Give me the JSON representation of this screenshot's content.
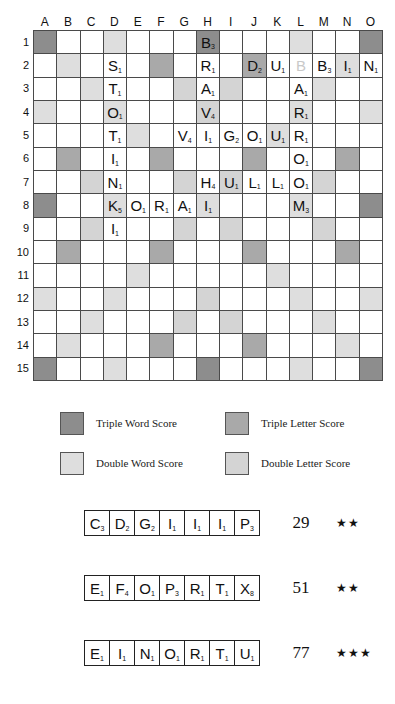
{
  "board": {
    "column_labels": [
      "A",
      "B",
      "C",
      "D",
      "E",
      "F",
      "G",
      "H",
      "I",
      "J",
      "K",
      "L",
      "M",
      "N",
      "O"
    ],
    "row_labels": [
      "1",
      "2",
      "3",
      "4",
      "5",
      "6",
      "7",
      "8",
      "9",
      "10",
      "11",
      "12",
      "13",
      "14",
      "15"
    ],
    "premium_legend_codes": {
      "tws": "Triple Word Score",
      "dws": "Double Word Score",
      "tls": "Triple Letter Score",
      "dls": "Double Letter Score"
    },
    "premium_layout": [
      [
        "tws",
        "",
        "",
        "dws",
        "",
        "",
        "",
        "tws",
        "",
        "",
        "",
        "dws",
        "",
        "",
        "tws"
      ],
      [
        "",
        "dws",
        "",
        "",
        "",
        "tls",
        "",
        "",
        "",
        "tls",
        "",
        "",
        "",
        "dws",
        ""
      ],
      [
        "",
        "",
        "dws",
        "",
        "",
        "",
        "dls",
        "",
        "dls",
        "",
        "",
        "",
        "dws",
        "",
        ""
      ],
      [
        "dws",
        "",
        "",
        "dws",
        "",
        "",
        "",
        "dls",
        "",
        "",
        "",
        "dws",
        "",
        "",
        "dws"
      ],
      [
        "",
        "",
        "",
        "",
        "dws",
        "",
        "",
        "",
        "",
        "",
        "dws",
        "",
        "",
        "",
        ""
      ],
      [
        "",
        "tls",
        "",
        "",
        "",
        "tls",
        "",
        "",
        "",
        "tls",
        "",
        "",
        "",
        "tls",
        ""
      ],
      [
        "",
        "",
        "dls",
        "",
        "",
        "",
        "dls",
        "",
        "dls",
        "",
        "",
        "",
        "dls",
        "",
        ""
      ],
      [
        "tws",
        "",
        "",
        "dws",
        "",
        "",
        "",
        "dws",
        "",
        "",
        "",
        "dws",
        "",
        "",
        "tws"
      ],
      [
        "",
        "",
        "dls",
        "",
        "",
        "",
        "dls",
        "",
        "dls",
        "",
        "",
        "",
        "dls",
        "",
        ""
      ],
      [
        "",
        "tls",
        "",
        "",
        "",
        "tls",
        "",
        "",
        "",
        "tls",
        "",
        "",
        "",
        "tls",
        ""
      ],
      [
        "",
        "",
        "",
        "",
        "dws",
        "",
        "",
        "",
        "",
        "",
        "dws",
        "",
        "",
        "",
        ""
      ],
      [
        "dws",
        "",
        "",
        "dws",
        "",
        "",
        "",
        "dls",
        "",
        "",
        "",
        "dws",
        "",
        "",
        "dws"
      ],
      [
        "",
        "",
        "dws",
        "",
        "",
        "",
        "dls",
        "",
        "dls",
        "",
        "",
        "",
        "dws",
        "",
        ""
      ],
      [
        "",
        "dws",
        "",
        "",
        "",
        "tls",
        "",
        "",
        "",
        "tls",
        "",
        "",
        "",
        "dws",
        ""
      ],
      [
        "tws",
        "",
        "",
        "dws",
        "",
        "",
        "",
        "tws",
        "",
        "",
        "",
        "dws",
        "",
        "",
        "tws"
      ]
    ],
    "tiles": [
      {
        "row": 1,
        "col": "H",
        "letter": "B",
        "value": "3",
        "blank": false
      },
      {
        "row": 2,
        "col": "D",
        "letter": "S",
        "value": "1",
        "blank": false
      },
      {
        "row": 2,
        "col": "H",
        "letter": "R",
        "value": "1",
        "blank": false
      },
      {
        "row": 2,
        "col": "J",
        "letter": "D",
        "value": "2",
        "blank": false
      },
      {
        "row": 2,
        "col": "K",
        "letter": "U",
        "value": "1",
        "blank": false
      },
      {
        "row": 2,
        "col": "L",
        "letter": "B",
        "value": "",
        "blank": true
      },
      {
        "row": 2,
        "col": "M",
        "letter": "B",
        "value": "3",
        "blank": false
      },
      {
        "row": 2,
        "col": "N",
        "letter": "I",
        "value": "1",
        "blank": false
      },
      {
        "row": 2,
        "col": "O",
        "letter": "N",
        "value": "1",
        "blank": false
      },
      {
        "row": 3,
        "col": "D",
        "letter": "T",
        "value": "1",
        "blank": false
      },
      {
        "row": 3,
        "col": "H",
        "letter": "A",
        "value": "1",
        "blank": false
      },
      {
        "row": 3,
        "col": "L",
        "letter": "A",
        "value": "1",
        "blank": false
      },
      {
        "row": 4,
        "col": "D",
        "letter": "O",
        "value": "1",
        "blank": false
      },
      {
        "row": 4,
        "col": "H",
        "letter": "V",
        "value": "4",
        "blank": false
      },
      {
        "row": 4,
        "col": "L",
        "letter": "R",
        "value": "1",
        "blank": false
      },
      {
        "row": 5,
        "col": "D",
        "letter": "T",
        "value": "1",
        "blank": false
      },
      {
        "row": 5,
        "col": "G",
        "letter": "V",
        "value": "4",
        "blank": false
      },
      {
        "row": 5,
        "col": "H",
        "letter": "I",
        "value": "1",
        "blank": false
      },
      {
        "row": 5,
        "col": "I",
        "letter": "G",
        "value": "2",
        "blank": false
      },
      {
        "row": 5,
        "col": "J",
        "letter": "O",
        "value": "1",
        "blank": false
      },
      {
        "row": 5,
        "col": "K",
        "letter": "U",
        "value": "1",
        "blank": false
      },
      {
        "row": 5,
        "col": "L",
        "letter": "R",
        "value": "1",
        "blank": false
      },
      {
        "row": 6,
        "col": "D",
        "letter": "I",
        "value": "1",
        "blank": false
      },
      {
        "row": 6,
        "col": "L",
        "letter": "O",
        "value": "1",
        "blank": false
      },
      {
        "row": 7,
        "col": "D",
        "letter": "N",
        "value": "1",
        "blank": false
      },
      {
        "row": 7,
        "col": "H",
        "letter": "H",
        "value": "4",
        "blank": false
      },
      {
        "row": 7,
        "col": "I",
        "letter": "U",
        "value": "1",
        "blank": false
      },
      {
        "row": 7,
        "col": "J",
        "letter": "L",
        "value": "1",
        "blank": false
      },
      {
        "row": 7,
        "col": "K",
        "letter": "L",
        "value": "1",
        "blank": false
      },
      {
        "row": 7,
        "col": "L",
        "letter": "O",
        "value": "1",
        "blank": false
      },
      {
        "row": 8,
        "col": "D",
        "letter": "K",
        "value": "5",
        "blank": false
      },
      {
        "row": 8,
        "col": "E",
        "letter": "O",
        "value": "1",
        "blank": false
      },
      {
        "row": 8,
        "col": "F",
        "letter": "R",
        "value": "1",
        "blank": false
      },
      {
        "row": 8,
        "col": "G",
        "letter": "A",
        "value": "1",
        "blank": false
      },
      {
        "row": 8,
        "col": "H",
        "letter": "I",
        "value": "1",
        "blank": false
      },
      {
        "row": 8,
        "col": "L",
        "letter": "M",
        "value": "3",
        "blank": false
      },
      {
        "row": 9,
        "col": "D",
        "letter": "I",
        "value": "1",
        "blank": false
      }
    ]
  },
  "legend": {
    "items": [
      {
        "code": "tws",
        "label": "Triple Word Score"
      },
      {
        "code": "tls",
        "label": "Triple Letter Score"
      },
      {
        "code": "dws",
        "label": "Double Word Score"
      },
      {
        "code": "dls",
        "label": "Double Letter Score"
      }
    ]
  },
  "racks": [
    {
      "tiles": [
        {
          "letter": "C",
          "value": "3"
        },
        {
          "letter": "D",
          "value": "2"
        },
        {
          "letter": "G",
          "value": "2"
        },
        {
          "letter": "I",
          "value": "1"
        },
        {
          "letter": "I",
          "value": "1"
        },
        {
          "letter": "I",
          "value": "1"
        },
        {
          "letter": "P",
          "value": "3"
        }
      ],
      "score": "29",
      "stars": "★★"
    },
    {
      "tiles": [
        {
          "letter": "E",
          "value": "1"
        },
        {
          "letter": "F",
          "value": "4"
        },
        {
          "letter": "O",
          "value": "1"
        },
        {
          "letter": "P",
          "value": "3"
        },
        {
          "letter": "R",
          "value": "1"
        },
        {
          "letter": "T",
          "value": "1"
        },
        {
          "letter": "X",
          "value": "8"
        }
      ],
      "score": "51",
      "stars": "★★"
    },
    {
      "tiles": [
        {
          "letter": "E",
          "value": "1"
        },
        {
          "letter": "I",
          "value": "1"
        },
        {
          "letter": "N",
          "value": "1"
        },
        {
          "letter": "O",
          "value": "1"
        },
        {
          "letter": "R",
          "value": "1"
        },
        {
          "letter": "T",
          "value": "1"
        },
        {
          "letter": "U",
          "value": "1"
        }
      ],
      "score": "77",
      "stars": "★★★"
    }
  ],
  "colors": {
    "tws": "#8d8d8d",
    "dws": "#dedede",
    "tls": "#a9a9a9",
    "dls": "#d4d4d4",
    "grid_line": "#4a4a4a"
  }
}
